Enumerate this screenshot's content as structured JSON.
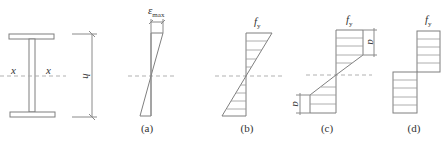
{
  "figure": {
    "section": {
      "axis_left_label": "x",
      "axis_right_label": "x",
      "depth_label": "h"
    },
    "panels": [
      {
        "id": "a",
        "caption": "(a)",
        "top_label": "ε",
        "top_label_sub": "max",
        "type": "strain-linear"
      },
      {
        "id": "b",
        "caption": "(b)",
        "top_label": "f",
        "top_label_sub": "y",
        "type": "stress-elastic"
      },
      {
        "id": "c",
        "caption": "(c)",
        "top_label": "f",
        "top_label_sub": "y",
        "side_label_top": "a",
        "side_label_bottom": "a",
        "type": "stress-partially-plastic"
      },
      {
        "id": "d",
        "caption": "(d)",
        "top_label": "f",
        "top_label_sub": "y",
        "type": "stress-fully-plastic"
      }
    ],
    "colors": {
      "line": "#7f7f7f",
      "dashed_axis": "#a8a8a8",
      "text": "#333333",
      "background": "#ffffff"
    }
  }
}
